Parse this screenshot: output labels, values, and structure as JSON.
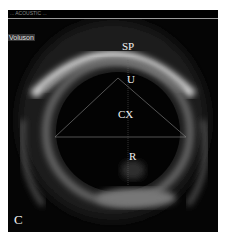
{
  "image": {
    "header_text": "... ACOUSTIC ...",
    "side_label": "Voluson",
    "panel_letter": "C",
    "annotations": [
      {
        "label": "SP",
        "meaning": "pubic symphysis"
      },
      {
        "label": "U",
        "meaning": "urethra"
      },
      {
        "label": "CX",
        "meaning": "cervix"
      },
      {
        "label": "R",
        "meaning": "rectum"
      }
    ],
    "colors": {
      "background": "#050505",
      "echo": "#cfcfcf",
      "text": "#f2f2f2"
    }
  }
}
